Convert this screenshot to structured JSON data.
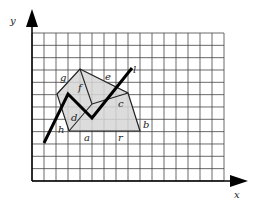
{
  "diagram": {
    "axes": {
      "x_label": "x",
      "y_label": "y",
      "origin": [
        32,
        181
      ],
      "x_end": [
        248,
        181
      ],
      "y_end": [
        32,
        9
      ]
    },
    "grid": {
      "x0": 32,
      "y0": 33,
      "cols": 16,
      "rows": 12,
      "cell_w": 12,
      "cell_h": 12.33,
      "line_color": "#444444"
    },
    "polygon": {
      "fill": "#d6d6d6",
      "stroke": "#222222",
      "points": [
        [
          80,
          69
        ],
        [
          128,
          93
        ],
        [
          140,
          131
        ],
        [
          69,
          131
        ],
        [
          57,
          94
        ]
      ]
    },
    "inner_lines": [
      {
        "from": [
          80,
          69
        ],
        "to": [
          92,
          104
        ]
      },
      {
        "from": [
          92,
          104
        ],
        "to": [
          128,
          93
        ]
      },
      {
        "from": [
          69,
          131
        ],
        "to": [
          92,
          104
        ]
      }
    ],
    "path_line": {
      "stroke": "#000000",
      "width": 3,
      "points": [
        [
          44,
          143
        ],
        [
          68,
          94
        ],
        [
          92,
          118
        ],
        [
          132,
          68
        ]
      ]
    },
    "labels": [
      {
        "text": "g",
        "x": 60,
        "y": 81
      },
      {
        "text": "f",
        "x": 78,
        "y": 91
      },
      {
        "text": "e",
        "x": 105,
        "y": 80
      },
      {
        "text": "l",
        "x": 133,
        "y": 73
      },
      {
        "text": "c",
        "x": 118,
        "y": 107
      },
      {
        "text": "d",
        "x": 71,
        "y": 121
      },
      {
        "text": "h",
        "x": 58,
        "y": 133
      },
      {
        "text": "b",
        "x": 143,
        "y": 128
      },
      {
        "text": "a",
        "x": 84,
        "y": 141
      },
      {
        "text": "r",
        "x": 118,
        "y": 141
      }
    ]
  }
}
